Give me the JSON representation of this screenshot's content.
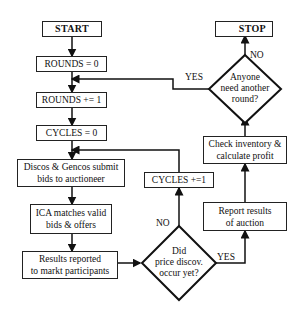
{
  "nodes": {
    "start": "START",
    "rounds_init": "ROUNDS = 0",
    "rounds_inc": "ROUNDS += 1",
    "cycles_init": "CYCLES = 0",
    "submit_bids_1": "Discos & Gencos submit",
    "submit_bids_2": "bids to auctioneer",
    "ica_match_1": "ICA matches valid",
    "ica_match_2": "bids & offers",
    "results_reported_1": "Results reported",
    "results_reported_2": "to markt participants",
    "price_decision_1": "Did",
    "price_decision_2": "price discov.",
    "price_decision_3": "occur yet?",
    "cycles_inc": "CYCLES +=1",
    "report_results_1": "Report results",
    "report_results_2": "of auction",
    "check_inventory_1": "Check inventory &",
    "check_inventory_2": "calculate profit",
    "round_decision_1": "Anyone",
    "round_decision_2": "need another",
    "round_decision_3": "round?",
    "stop": "STOP"
  },
  "edge_labels": {
    "price_no": "NO",
    "price_yes": "YES",
    "round_yes": "YES",
    "round_no": "NO"
  }
}
